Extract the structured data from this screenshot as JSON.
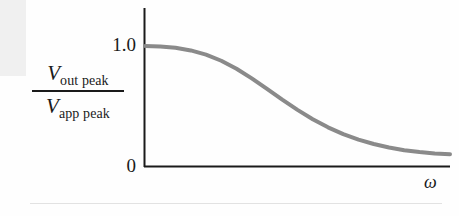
{
  "figure": {
    "background_color": "#fefefe",
    "axis_color": "#1a1a1a",
    "curve_color": "#8a8a8a",
    "artifact_color": "#f0f0f0",
    "rule_color": "#e2e2e2"
  },
  "labels": {
    "y_axis": {
      "numerator_symbol": "V",
      "numerator_subscript": "out peak",
      "denominator_symbol": "V",
      "denominator_subscript": "app peak"
    },
    "x_axis_symbol": "ω",
    "tick_one": "1.0",
    "tick_zero": "0"
  },
  "chart_data": {
    "type": "line",
    "title": "",
    "xlabel": "ω",
    "ylabel": "V_out peak / V_app peak",
    "xlim": [
      0,
      1
    ],
    "ylim": [
      0,
      1.12
    ],
    "grid": false,
    "legend": null,
    "ticks": {
      "y": [
        {
          "value": 0,
          "label": "0"
        },
        {
          "value": 1.0,
          "label": "1.0"
        }
      ],
      "x": []
    },
    "series": [
      {
        "name": "amplitude ratio",
        "color": "#8a8a8a",
        "x": [
          0.0,
          0.05,
          0.1,
          0.15,
          0.2,
          0.25,
          0.3,
          0.35,
          0.4,
          0.45,
          0.5,
          0.55,
          0.6,
          0.65,
          0.7,
          0.75,
          0.8,
          0.85,
          0.9,
          0.95,
          1.0
        ],
        "y": [
          1.0,
          0.996,
          0.985,
          0.963,
          0.928,
          0.877,
          0.81,
          0.73,
          0.643,
          0.553,
          0.468,
          0.39,
          0.322,
          0.266,
          0.22,
          0.183,
          0.154,
          0.132,
          0.116,
          0.105,
          0.098
        ]
      }
    ]
  }
}
